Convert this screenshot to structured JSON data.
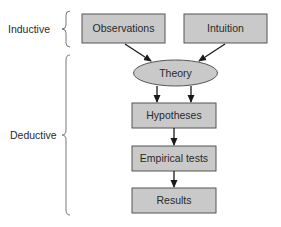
{
  "diagram": {
    "groups": [
      {
        "id": "inductive",
        "label": "Inductive"
      },
      {
        "id": "deductive",
        "label": "Deductive"
      }
    ],
    "nodes": [
      {
        "id": "observations",
        "label": "Observations",
        "shape": "rectangle"
      },
      {
        "id": "intuition",
        "label": "Intuition",
        "shape": "rectangle"
      },
      {
        "id": "theory",
        "label": "Theory",
        "shape": "ellipse"
      },
      {
        "id": "hypotheses",
        "label": "Hypotheses",
        "shape": "rectangle"
      },
      {
        "id": "empirical_tests",
        "label": "Empirical tests",
        "shape": "rectangle"
      },
      {
        "id": "results",
        "label": "Results",
        "shape": "rectangle"
      }
    ],
    "edges": [
      {
        "from": "observations",
        "to": "theory"
      },
      {
        "from": "intuition",
        "to": "theory"
      },
      {
        "from": "theory",
        "to": "hypotheses"
      },
      {
        "from": "theory",
        "to": "hypotheses"
      },
      {
        "from": "hypotheses",
        "to": "empirical_tests"
      },
      {
        "from": "empirical_tests",
        "to": "results"
      }
    ],
    "colors": {
      "fill": "#c9c9c9",
      "stroke": "#555555",
      "text": "#2a2a2a",
      "arrow": "#1a1a1a"
    }
  }
}
